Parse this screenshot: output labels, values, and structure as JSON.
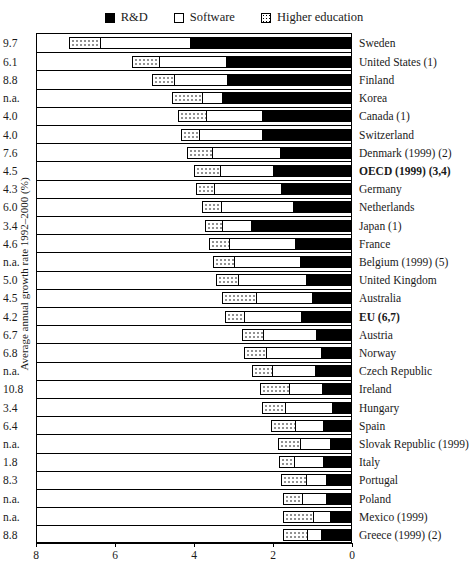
{
  "chart_data": {
    "type": "bar",
    "subtype": "stacked-horizontal",
    "title": "",
    "xlabel": "",
    "ylabel": "Average annual growth rate 1992–2000 (%)",
    "xlim": [
      8,
      0
    ],
    "x_reversed": true,
    "xticks": [
      8,
      6,
      4,
      2,
      0
    ],
    "xticklabels": [
      "8",
      "6",
      "4",
      "2",
      "0"
    ],
    "grid": false,
    "legend_position": "top-center",
    "legend": [
      "R&D",
      "Software",
      "Higher education"
    ],
    "series": [
      {
        "name": "Higher education",
        "key": "he",
        "swatch": "dotted"
      },
      {
        "name": "Software",
        "key": "sw",
        "swatch": "white"
      },
      {
        "name": "R&D",
        "key": "rd",
        "swatch": "black"
      }
    ],
    "categories": [
      "Sweden",
      "United States (1)",
      "Finland",
      "Korea",
      "Canada (1)",
      "Switzerland",
      "Denmark (1999) (2)",
      "OECD (1999) (3,4)",
      "Germany",
      "Netherlands",
      "Japan (1)",
      "France",
      "Belgium (1999) (5)",
      "United Kingdom",
      "Australia",
      "EU (6,7)",
      "Austria",
      "Norway",
      "Czech Republic",
      "Ireland",
      "Hungary",
      "Spain",
      "Slovak Republic (1999)",
      "Italy",
      "Portugal",
      "Poland",
      "Mexico (1999)",
      "Greece (1999) (2)"
    ],
    "value_column_header": "",
    "rows": [
      {
        "country": "Sweden",
        "growth": "9.7",
        "he": 0.8,
        "sw": 2.28,
        "rd": 4.07,
        "total": 7.15,
        "bold": false
      },
      {
        "country": "United States (1)",
        "growth": "6.1",
        "he": 0.68,
        "sw": 1.7,
        "rd": 3.17,
        "total": 5.55,
        "bold": false
      },
      {
        "country": "Finland",
        "growth": "8.8",
        "he": 0.56,
        "sw": 1.35,
        "rd": 3.13,
        "total": 5.04,
        "bold": false
      },
      {
        "country": "Korea",
        "growth": "n.a.",
        "he": 0.74,
        "sw": 0.52,
        "rd": 3.26,
        "total": 4.52,
        "bold": false
      },
      {
        "country": "Canada (1)",
        "growth": "4.0",
        "he": 0.71,
        "sw": 1.42,
        "rd": 2.26,
        "total": 4.39,
        "bold": false
      },
      {
        "country": "Switzerland",
        "growth": "4.0",
        "he": 0.45,
        "sw": 1.6,
        "rd": 2.26,
        "total": 4.31,
        "bold": false
      },
      {
        "country": "Denmark (1999) (2)",
        "growth": "7.6",
        "he": 0.62,
        "sw": 1.73,
        "rd": 1.8,
        "total": 4.15,
        "bold": false
      },
      {
        "country": "OECD (1999) (3,4)",
        "growth": "4.5",
        "he": 0.66,
        "sw": 1.35,
        "rd": 1.97,
        "total": 3.98,
        "bold": true
      },
      {
        "country": "Germany",
        "growth": "4.3",
        "he": 0.45,
        "sw": 1.69,
        "rd": 1.78,
        "total": 3.92,
        "bold": false
      },
      {
        "country": "Netherlands",
        "growth": "6.0",
        "he": 0.49,
        "sw": 1.81,
        "rd": 1.47,
        "total": 3.77,
        "bold": false
      },
      {
        "country": "Japan (1)",
        "growth": "3.4",
        "he": 0.43,
        "sw": 0.73,
        "rd": 2.54,
        "total": 3.7,
        "bold": false
      },
      {
        "country": "France",
        "growth": "4.6",
        "he": 0.51,
        "sw": 1.65,
        "rd": 1.43,
        "total": 3.59,
        "bold": false
      },
      {
        "country": "Belgium (1999) (5)",
        "growth": "n.a.",
        "he": 0.54,
        "sw": 1.67,
        "rd": 1.29,
        "total": 3.5,
        "bold": false
      },
      {
        "country": "United Kingdom",
        "growth": "5.0",
        "he": 0.56,
        "sw": 1.72,
        "rd": 1.13,
        "total": 3.41,
        "bold": false
      },
      {
        "country": "Australia",
        "growth": "4.5",
        "he": 0.85,
        "sw": 1.42,
        "rd": 0.99,
        "total": 3.26,
        "bold": false
      },
      {
        "country": "EU (6,7)",
        "growth": "4.2",
        "he": 0.5,
        "sw": 1.44,
        "rd": 1.26,
        "total": 3.2,
        "bold": true
      },
      {
        "country": "Austria",
        "growth": "6.7",
        "he": 0.51,
        "sw": 1.35,
        "rd": 0.89,
        "total": 2.75,
        "bold": false
      },
      {
        "country": "Norway",
        "growth": "6.8",
        "he": 0.54,
        "sw": 1.4,
        "rd": 0.76,
        "total": 2.7,
        "bold": false
      },
      {
        "country": "Czech Republic",
        "growth": "n.a.",
        "he": 0.5,
        "sw": 1.08,
        "rd": 0.92,
        "total": 2.5,
        "bold": false
      },
      {
        "country": "Ireland",
        "growth": "10.8",
        "he": 0.72,
        "sw": 0.85,
        "rd": 0.73,
        "total": 2.3,
        "bold": false
      },
      {
        "country": "Hungary",
        "growth": "3.4",
        "he": 0.58,
        "sw": 1.2,
        "rd": 0.47,
        "total": 2.25,
        "bold": false
      },
      {
        "country": "Spain",
        "growth": "6.4",
        "he": 0.6,
        "sw": 0.7,
        "rd": 0.72,
        "total": 2.02,
        "bold": false
      },
      {
        "country": "Slovak Republic (1999)",
        "growth": "n.a.",
        "he": 0.57,
        "sw": 0.75,
        "rd": 0.54,
        "total": 1.86,
        "bold": false
      },
      {
        "country": "Italy",
        "growth": "1.8",
        "he": 0.38,
        "sw": 0.73,
        "rd": 0.72,
        "total": 1.83,
        "bold": false
      },
      {
        "country": "Portugal",
        "growth": "8.3",
        "he": 0.63,
        "sw": 0.5,
        "rd": 0.64,
        "total": 1.77,
        "bold": false
      },
      {
        "country": "Poland",
        "growth": "n.a.",
        "he": 0.5,
        "sw": 0.59,
        "rd": 0.64,
        "total": 1.73,
        "bold": false
      },
      {
        "country": "Mexico (1999)",
        "growth": "n.a.",
        "he": 0.76,
        "sw": 0.44,
        "rd": 0.52,
        "total": 1.72,
        "bold": false
      },
      {
        "country": "Greece (1999) (2)",
        "growth": "8.8",
        "he": 0.59,
        "sw": 0.37,
        "rd": 0.75,
        "total": 1.71,
        "bold": false
      }
    ]
  },
  "colors": {
    "rd": "#000000",
    "software": "#ffffff",
    "higher_education": "#ffffff",
    "outline": "#000000",
    "background": "#ffffff"
  }
}
